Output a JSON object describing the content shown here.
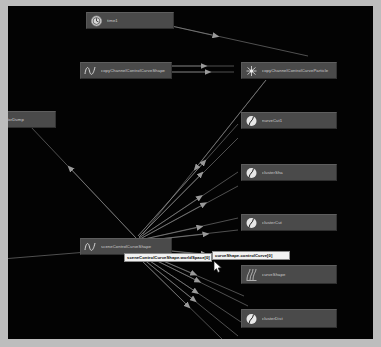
{
  "app": {
    "title": "Hypergraph Connection Editor",
    "canvas_background": "#030303",
    "frame_background": "#bdbdbd",
    "node_fill": "#4a4a4a",
    "node_text_color": "#cfcfcf",
    "edge_color": "#8f8f8f",
    "tooltip_background": "#f2f2f2",
    "tooltip_text_color": "#060606"
  },
  "graph": {
    "nodes": [
      {
        "id": "time1",
        "label": "time1",
        "icon": "clock-icon",
        "x": 78,
        "y": 6,
        "w": 88
      },
      {
        "id": "copyChannelControlCurveShape",
        "label": "copyChannelControlCurveShape",
        "icon": "curve-icon",
        "x": 72,
        "y": 56,
        "w": 92
      },
      {
        "id": "copyChannelControlCurveParticle",
        "label": "copyChannelControlCurveParticle",
        "icon": "particle-icon",
        "x": 233,
        "y": 56,
        "w": 96
      },
      {
        "id": "curveColorDump",
        "label": "curveColorDump",
        "icon": "none",
        "x": -22,
        "y": 105,
        "w": 70
      },
      {
        "id": "nurveCut1",
        "label": "nurveCut1",
        "icon": "circle-icon",
        "x": 233,
        "y": 106,
        "w": 96
      },
      {
        "id": "clusterSha",
        "label": "clusterSha",
        "icon": "circle-icon",
        "x": 233,
        "y": 158,
        "w": 96
      },
      {
        "id": "clusterCut",
        "label": "clusterCut",
        "icon": "circle-icon",
        "x": 233,
        "y": 208,
        "w": 96
      },
      {
        "id": "sceneControlCurveShape",
        "label": "sceneControlCurveShape",
        "icon": "curve-icon",
        "x": 72,
        "y": 232,
        "w": 92
      },
      {
        "id": "curveShape",
        "label": "curveShape",
        "icon": "deform-icon",
        "x": 233,
        "y": 259,
        "w": 96
      },
      {
        "id": "clusterDist",
        "label": "clusterDist",
        "icon": "circle-icon",
        "x": 233,
        "y": 303,
        "w": 96
      }
    ],
    "connection_tooltips": [
      {
        "id": "tip-left",
        "label": "sceneControlCurveShape.worldSpace[0]",
        "x": 116,
        "y": 247,
        "w": 88
      },
      {
        "id": "tip-right",
        "label": "curveShape.controlCurve[0]",
        "x": 204,
        "y": 245,
        "w": 78
      }
    ],
    "edges": [
      {
        "from": "time1",
        "to": "copyChannelControlCurveParticle"
      },
      {
        "from": "copyChannelControlCurveShape",
        "to": "copyChannelControlCurveParticle"
      },
      {
        "from": "copyChannelControlCurveParticle",
        "to": "sceneControlCurveShape"
      },
      {
        "from": "sceneControlCurveShape",
        "to": "nurveCut1"
      },
      {
        "from": "sceneControlCurveShape",
        "to": "clusterSha"
      },
      {
        "from": "sceneControlCurveShape",
        "to": "clusterCut"
      },
      {
        "from": "sceneControlCurveShape",
        "to": "curveShape"
      },
      {
        "from": "sceneControlCurveShape",
        "to": "clusterDist"
      },
      {
        "from": "sceneControlCurveShape",
        "to": "curveColorDump"
      }
    ],
    "cursor": {
      "x": 207,
      "y": 256
    }
  }
}
